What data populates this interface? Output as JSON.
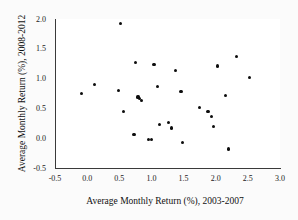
{
  "chart_data": {
    "type": "scatter",
    "title": "",
    "xlabel": "Average Monthly Return (%), 2003-2007",
    "ylabel": "Average Monthly Return (%), 2008-2012",
    "xlim": [
      -0.5,
      3.0
    ],
    "ylim": [
      -0.5,
      2.0
    ],
    "xticks": [
      "-0.5",
      "0.0",
      "0.5",
      "1.0",
      "1.5",
      "2.0",
      "2.5",
      "3.0"
    ],
    "xtick_values": [
      -0.5,
      0.0,
      0.5,
      1.0,
      1.5,
      2.0,
      2.5,
      3.0
    ],
    "yticks": [
      "-0.5",
      "0.0",
      "0.5",
      "1.0",
      "1.5",
      "2.0"
    ],
    "ytick_values": [
      -0.5,
      0.0,
      0.5,
      1.0,
      1.5,
      2.0
    ],
    "minor_ticks": true,
    "grid": false,
    "legend": "none",
    "marker": "filled-circle",
    "marker_color": "#0d0d0d",
    "points": [
      {
        "x": -0.09,
        "y": 0.75
      },
      {
        "x": 0.11,
        "y": 0.9
      },
      {
        "x": 0.52,
        "y": 1.92
      },
      {
        "x": 0.49,
        "y": 0.8
      },
      {
        "x": 0.56,
        "y": 0.45
      },
      {
        "x": 0.73,
        "y": 0.06
      },
      {
        "x": 0.75,
        "y": 1.27
      },
      {
        "x": 0.79,
        "y": 0.69
      },
      {
        "x": 0.82,
        "y": 0.66
      },
      {
        "x": 0.85,
        "y": 0.63
      },
      {
        "x": 0.96,
        "y": -0.02
      },
      {
        "x": 1.0,
        "y": -0.02
      },
      {
        "x": 1.04,
        "y": 1.23
      },
      {
        "x": 1.09,
        "y": 0.87
      },
      {
        "x": 1.12,
        "y": 0.23
      },
      {
        "x": 1.27,
        "y": 0.27
      },
      {
        "x": 1.31,
        "y": 0.17
      },
      {
        "x": 1.38,
        "y": 1.13
      },
      {
        "x": 1.46,
        "y": 0.78
      },
      {
        "x": 1.48,
        "y": -0.07
      },
      {
        "x": 1.75,
        "y": 0.52
      },
      {
        "x": 1.88,
        "y": 0.45
      },
      {
        "x": 1.94,
        "y": 0.37
      },
      {
        "x": 1.97,
        "y": 0.19
      },
      {
        "x": 2.03,
        "y": 1.21
      },
      {
        "x": 2.15,
        "y": 0.71
      },
      {
        "x": 2.2,
        "y": -0.18
      },
      {
        "x": 2.32,
        "y": 1.37
      },
      {
        "x": 2.52,
        "y": 1.02
      }
    ]
  }
}
